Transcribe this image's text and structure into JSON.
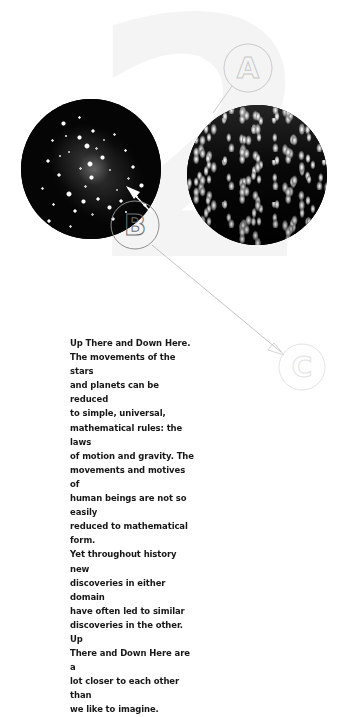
{
  "page": {
    "chapter_number": "2",
    "background_color": "#ffffff",
    "watermark_color": "#f4f4f4"
  },
  "figures": [
    {
      "id": "galaxy",
      "name": "spiral-galaxy-photo",
      "description": "Black and white photograph of a spiral galaxy / star cluster",
      "shape": "circle"
    },
    {
      "id": "crowd",
      "name": "crowd-photo",
      "description": "High contrast black and white photograph of a dense crowd of people",
      "shape": "circle"
    }
  ],
  "markers": [
    {
      "id": "a",
      "label": "A",
      "color": "#c9c9c9",
      "cx": 248,
      "cy": 68,
      "r": 24
    },
    {
      "id": "b",
      "label": "B",
      "color": "#8f8f8f",
      "cx": 135,
      "cy": 225,
      "r": 24
    },
    {
      "id": "c",
      "label": "C",
      "color": "#e3e3e3",
      "cx": 302,
      "cy": 367,
      "r": 23
    }
  ],
  "body": {
    "heading": "Up There and Down Here.",
    "text": "Up There and Down Here.\nThe movements of the stars\nand planets can be reduced\nto simple, universal,\nmathematical rules: the laws\nof motion and gravity. The\nmovements and motives of\nhuman beings are not so easily\nreduced to mathematical form.\nYet throughout history new\ndiscoveries in either domain\nhave often led to similar\ndiscoveries in the other. Up\nThere and Down Here are a\nlot closer to each other than\nwe like to imagine.",
    "text_color": "#161616"
  }
}
